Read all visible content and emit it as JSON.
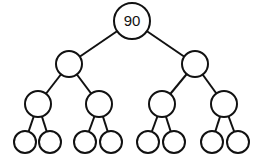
{
  "diagram": {
    "type": "binary-tree",
    "levels": 4,
    "nodes": [
      {
        "id": "n0",
        "label": "90",
        "cx": 132,
        "cy": 21,
        "r": 18
      },
      {
        "id": "n1",
        "label": "",
        "cx": 69,
        "cy": 64,
        "r": 13
      },
      {
        "id": "n2",
        "label": "",
        "cx": 195,
        "cy": 64,
        "r": 13
      },
      {
        "id": "n3",
        "label": "",
        "cx": 38,
        "cy": 104,
        "r": 13
      },
      {
        "id": "n4",
        "label": "",
        "cx": 99,
        "cy": 104,
        "r": 13
      },
      {
        "id": "n5",
        "label": "",
        "cx": 162,
        "cy": 104,
        "r": 13
      },
      {
        "id": "n6",
        "label": "",
        "cx": 224,
        "cy": 104,
        "r": 13
      },
      {
        "id": "n7",
        "label": "",
        "cx": 25,
        "cy": 142,
        "r": 11
      },
      {
        "id": "n8",
        "label": "",
        "cx": 50,
        "cy": 142,
        "r": 11
      },
      {
        "id": "n9",
        "label": "",
        "cx": 85,
        "cy": 142,
        "r": 11
      },
      {
        "id": "n10",
        "label": "",
        "cx": 111,
        "cy": 142,
        "r": 11
      },
      {
        "id": "n11",
        "label": "",
        "cx": 148,
        "cy": 142,
        "r": 11
      },
      {
        "id": "n12",
        "label": "",
        "cx": 174,
        "cy": 142,
        "r": 11
      },
      {
        "id": "n13",
        "label": "",
        "cx": 212,
        "cy": 142,
        "r": 11
      },
      {
        "id": "n14",
        "label": "",
        "cx": 238,
        "cy": 142,
        "r": 11
      }
    ],
    "edges": [
      [
        "n0",
        "n1"
      ],
      [
        "n0",
        "n2"
      ],
      [
        "n1",
        "n3"
      ],
      [
        "n1",
        "n4"
      ],
      [
        "n2",
        "n5"
      ],
      [
        "n2",
        "n6"
      ],
      [
        "n3",
        "n7"
      ],
      [
        "n3",
        "n8"
      ],
      [
        "n4",
        "n9"
      ],
      [
        "n4",
        "n10"
      ],
      [
        "n5",
        "n11"
      ],
      [
        "n5",
        "n12"
      ],
      [
        "n6",
        "n13"
      ],
      [
        "n6",
        "n14"
      ]
    ]
  }
}
